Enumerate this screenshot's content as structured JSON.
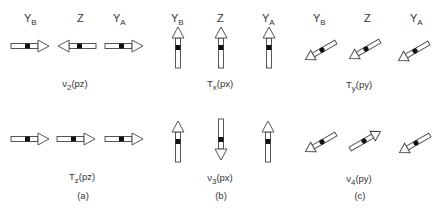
{
  "figure": {
    "panels": [
      {
        "id": "a",
        "caption": "(a)",
        "atom_labels": [
          {
            "main": "Y",
            "sub": "B"
          },
          {
            "main": "Z",
            "sub": ""
          },
          {
            "main": "Y",
            "sub": "A"
          }
        ],
        "modes": [
          {
            "sym": "ν",
            "sub": "2",
            "rest": "(pz)",
            "arrows": [
              "right",
              "left",
              "right"
            ]
          },
          {
            "sym": "T",
            "sub": "z",
            "rest": "(pz)",
            "arrows": [
              "right",
              "right",
              "right"
            ]
          }
        ]
      },
      {
        "id": "b",
        "caption": "(b)",
        "atom_labels": [
          {
            "main": "Y",
            "sub": "B"
          },
          {
            "main": "Z",
            "sub": ""
          },
          {
            "main": "Y",
            "sub": "A"
          }
        ],
        "modes": [
          {
            "sym": "T",
            "sub": "x",
            "rest": "(px)",
            "arrows": [
              "up",
              "up",
              "up"
            ]
          },
          {
            "sym": "ν",
            "sub": "3",
            "rest": "(px)",
            "arrows": [
              "up",
              "down",
              "up"
            ]
          }
        ]
      },
      {
        "id": "c",
        "caption": "(c)",
        "atom_labels": [
          {
            "main": "Y",
            "sub": "B"
          },
          {
            "main": "Z",
            "sub": ""
          },
          {
            "main": "Y",
            "sub": "A"
          }
        ],
        "modes": [
          {
            "sym": "T",
            "sub": "y",
            "rest": "(py)",
            "arrows": [
              "down-left",
              "down-left",
              "down-left"
            ]
          },
          {
            "sym": "ν",
            "sub": "4",
            "rest": "(py)",
            "arrows": [
              "down-left",
              "up-right",
              "down-left"
            ]
          }
        ]
      }
    ],
    "colors": {
      "stroke": "#444444",
      "atom": "#111111",
      "fill": "#ffffff"
    }
  }
}
